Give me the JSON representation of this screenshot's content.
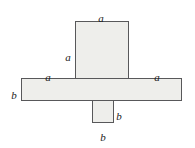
{
  "figure": {
    "type": "geometric-net-diagram",
    "colors": {
      "fill": "#eeeeeb",
      "stroke": "#58585a",
      "label": "#1b1b1b",
      "background": "#ffffff"
    },
    "shapes": [
      {
        "id": "face-top",
        "name": "upper-vertical-rectangle",
        "x": 75,
        "y": 21,
        "width": 54,
        "height": 58
      },
      {
        "id": "face-band",
        "name": "horizontal-band-rectangle",
        "x": 21,
        "y": 78,
        "width": 161,
        "height": 23
      },
      {
        "id": "face-bottom",
        "name": "lower-small-square",
        "x": 92,
        "y": 100,
        "width": 22,
        "height": 23
      }
    ],
    "labels": {
      "a_top": "a",
      "a_left": "a",
      "a_band_left": "a",
      "a_band_right": "a",
      "b_left": "b",
      "b_right": "b",
      "b_bottom": "b"
    }
  }
}
